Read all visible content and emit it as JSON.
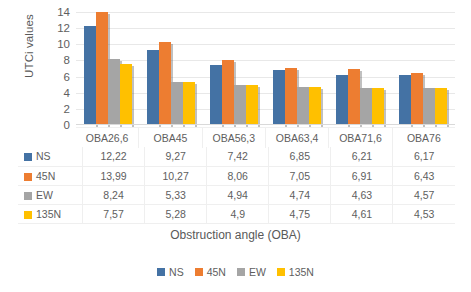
{
  "chart_data": {
    "type": "bar",
    "title": "",
    "xlabel": "Obstruction angle (OBA)",
    "ylabel": "UTCi values",
    "ylim": [
      0,
      14
    ],
    "yticks": [
      14,
      12,
      10,
      8,
      6,
      4,
      2,
      0
    ],
    "grid": true,
    "legend_position": "bottom",
    "categories": [
      "OBA26,6",
      "OBA45",
      "OBA56,3",
      "OBA63,4",
      "OBA71,6",
      "OBA76"
    ],
    "series": [
      {
        "name": "NS",
        "color": "#4472A4",
        "values": [
          12.22,
          9.27,
          7.42,
          6.85,
          6.21,
          6.17
        ],
        "labels": [
          "12,22",
          "9,27",
          "7,42",
          "6,85",
          "6,21",
          "6,17"
        ]
      },
      {
        "name": "45N",
        "color": "#ED7D31",
        "values": [
          13.99,
          10.27,
          8.06,
          7.05,
          6.91,
          6.43
        ],
        "labels": [
          "13,99",
          "10,27",
          "8,06",
          "7,05",
          "6,91",
          "6,43"
        ]
      },
      {
        "name": "EW",
        "color": "#A5A5A5",
        "values": [
          8.24,
          5.33,
          4.94,
          4.74,
          4.63,
          4.57
        ],
        "labels": [
          "8,24",
          "5,33",
          "4,94",
          "4,74",
          "4,63",
          "4,57"
        ]
      },
      {
        "name": "135N",
        "color": "#FFC000",
        "values": [
          7.57,
          5.28,
          4.9,
          4.75,
          4.61,
          4.53
        ],
        "labels": [
          "7,57",
          "5,28",
          "4,9",
          "4,75",
          "4,61",
          "4,53"
        ]
      }
    ]
  },
  "legend": {
    "items": [
      {
        "label": "NS",
        "color": "#4472A4"
      },
      {
        "label": "45N",
        "color": "#ED7D31"
      },
      {
        "label": "EW",
        "color": "#A5A5A5"
      },
      {
        "label": "135N",
        "color": "#FFC000"
      }
    ]
  }
}
